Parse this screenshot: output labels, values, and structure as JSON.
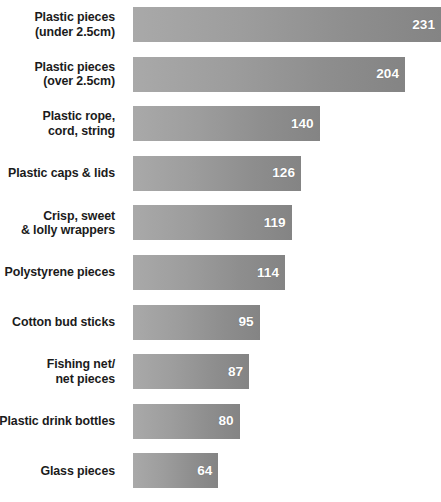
{
  "chart_data": {
    "type": "bar",
    "orientation": "horizontal",
    "title": "",
    "xlabel": "",
    "ylabel": "",
    "grid": false,
    "legend": null,
    "xlim": [
      0,
      231
    ],
    "value_label_position": "inside-end",
    "categories": [
      "Plastic pieces (under 2.5cm)",
      "Plastic pieces (over 2.5cm)",
      "Plastic rope, cord, string",
      "Plastic caps & lids",
      "Crisp, sweet & lolly wrappers",
      "Polystyrene pieces",
      "Cotton bud sticks",
      "Fishing net/ net pieces",
      "Plastic drink bottles",
      "Glass pieces"
    ],
    "values": [
      231,
      204,
      140,
      126,
      119,
      114,
      95,
      87,
      80,
      64
    ]
  },
  "top_clipped_text": "",
  "colors": {
    "bar_light": "#a9a9a9",
    "bar_dark": "#848484",
    "label_text": "#1b1b1b",
    "value_text": "#ffffff",
    "background": "#ffffff"
  },
  "rows": [
    {
      "label_lines": [
        "Plastic pieces",
        "(under 2.5cm)"
      ],
      "value": "231"
    },
    {
      "label_lines": [
        "Plastic pieces",
        "(over 2.5cm)"
      ],
      "value": "204"
    },
    {
      "label_lines": [
        "Plastic rope,",
        "cord, string"
      ],
      "value": "140"
    },
    {
      "label_lines": [
        "Plastic caps & lids"
      ],
      "value": "126"
    },
    {
      "label_lines": [
        "Crisp, sweet",
        "& lolly wrappers"
      ],
      "value": "119"
    },
    {
      "label_lines": [
        "Polystyrene pieces"
      ],
      "value": "114"
    },
    {
      "label_lines": [
        "Cotton bud sticks"
      ],
      "value": "95"
    },
    {
      "label_lines": [
        "Fishing net/",
        "net pieces"
      ],
      "value": "87"
    },
    {
      "label_lines": [
        "Plastic drink bottles"
      ],
      "value": "80"
    },
    {
      "label_lines": [
        "Glass pieces"
      ],
      "value": "64"
    }
  ]
}
